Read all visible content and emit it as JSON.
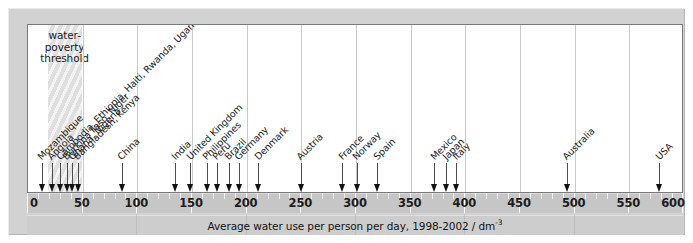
{
  "chart_data": {
    "type": "scatter",
    "title": "",
    "xlabel": "Average water use per person per day, 1998-2002 / dm",
    "xlabel_sup": "-3",
    "ylabel": "",
    "xlim": [
      0,
      600
    ],
    "xticks": [
      0,
      50,
      100,
      150,
      200,
      250,
      300,
      350,
      400,
      450,
      500,
      550,
      600
    ],
    "xtick_labels": [
      "0",
      "50",
      "100",
      "150",
      "200",
      "250",
      "300",
      "350",
      "400",
      "450",
      "500",
      "550",
      "600"
    ],
    "minor_tick_step": 10,
    "grid": true,
    "legend": "none",
    "annotation": {
      "text": "water-\npoverty\nthreshold",
      "band_start": 18,
      "band_end": 49
    },
    "markers": [
      {
        "label": "Mozambique",
        "value": 13
      },
      {
        "label": "Angola",
        "value": 22
      },
      {
        "label": "Cambodia",
        "value": 30
      },
      {
        "label": "Ethiopia",
        "value": 36
      },
      {
        "label": "Haiti",
        "value": 38
      },
      {
        "label": "Rwanda",
        "value": 40
      },
      {
        "label": "Uganda",
        "value": 42
      },
      {
        "label": "Burkina Faso",
        "value": 30
      },
      {
        "label": "Niger",
        "value": 32
      },
      {
        "label": "Ghana",
        "value": 36
      },
      {
        "label": "Nigeria",
        "value": 38
      },
      {
        "label": "Bangladesh",
        "value": 46
      },
      {
        "label": "Kenya",
        "value": 49
      },
      {
        "label": "China",
        "value": 86
      },
      {
        "label": "India",
        "value": 135
      },
      {
        "label": "United Kingdom",
        "value": 149
      },
      {
        "label": "Philippines",
        "value": 164
      },
      {
        "label": "Peru",
        "value": 173
      },
      {
        "label": "Brazil",
        "value": 184
      },
      {
        "label": "Germany",
        "value": 193
      },
      {
        "label": "Denmark",
        "value": 211
      },
      {
        "label": "Austria",
        "value": 250
      },
      {
        "label": "France",
        "value": 288
      },
      {
        "label": "Norway",
        "value": 301
      },
      {
        "label": "Spain",
        "value": 320
      },
      {
        "label": "Mexico",
        "value": 372
      },
      {
        "label": "Japan",
        "value": 383
      },
      {
        "label": "Italy",
        "value": 392
      },
      {
        "label": "Australia",
        "value": 493
      },
      {
        "label": "USA",
        "value": 578
      }
    ],
    "arrow_groups": [
      {
        "labels": [
          "Mozambique"
        ],
        "value": 13
      },
      {
        "labels": [
          "Angola"
        ],
        "value": 22
      },
      {
        "labels": [
          "Cambodia",
          "Burkina Faso"
        ],
        "value": 30
      },
      {
        "labels": [
          "Ethiopia",
          "Ghana"
        ],
        "value": 38
      },
      {
        "labels": [
          "Haiti",
          "Nigeria",
          "Niger"
        ],
        "value": 43
      },
      {
        "labels": [
          "Rwanda",
          "Uganda",
          "Bangladesh",
          "Kenya"
        ],
        "value": 49
      },
      {
        "labels": [
          "China"
        ],
        "value": 86
      },
      {
        "labels": [
          "India"
        ],
        "value": 135
      },
      {
        "labels": [
          "United Kingdom"
        ],
        "value": 149
      },
      {
        "labels": [
          "Philippines"
        ],
        "value": 164
      },
      {
        "labels": [
          "Peru"
        ],
        "value": 173
      },
      {
        "labels": [
          "Brazil"
        ],
        "value": 184
      },
      {
        "labels": [
          "Germany"
        ],
        "value": 193
      },
      {
        "labels": [
          "Denmark"
        ],
        "value": 211
      },
      {
        "labels": [
          "Austria"
        ],
        "value": 250
      },
      {
        "labels": [
          "France"
        ],
        "value": 288
      },
      {
        "labels": [
          "Norway"
        ],
        "value": 301
      },
      {
        "labels": [
          "Spain"
        ],
        "value": 320
      },
      {
        "labels": [
          "Mexico"
        ],
        "value": 372
      },
      {
        "labels": [
          "Japan"
        ],
        "value": 383
      },
      {
        "labels": [
          "Italy"
        ],
        "value": 392
      },
      {
        "labels": [
          "Australia"
        ],
        "value": 493
      },
      {
        "labels": [
          "USA"
        ],
        "value": 578
      }
    ],
    "label_stack": [
      {
        "text": "Mozambique",
        "value": 13
      },
      {
        "text": "Angola",
        "value": 22
      },
      {
        "text": "Cambodia, Ethiopia, Haiti, Rwanda, Uganda",
        "value": 30
      },
      {
        "text": "Burkina Faso, Niger",
        "value": 36
      },
      {
        "text": "Ghana, Nigeria",
        "value": 41
      },
      {
        "text": "Bangladesh, Kenya",
        "value": 46
      },
      {
        "text": "China",
        "value": 86
      },
      {
        "text": "India",
        "value": 135
      },
      {
        "text": "United Kingdom",
        "value": 149
      },
      {
        "text": "Philippines",
        "value": 164
      },
      {
        "text": "Peru",
        "value": 173
      },
      {
        "text": "Brazil",
        "value": 184
      },
      {
        "text": "Germany",
        "value": 193
      },
      {
        "text": "Denmark",
        "value": 211
      },
      {
        "text": "Austria",
        "value": 250
      },
      {
        "text": "France",
        "value": 288
      },
      {
        "text": "Norway",
        "value": 301
      },
      {
        "text": "Spain",
        "value": 320
      },
      {
        "text": "Mexico",
        "value": 372
      },
      {
        "text": "Japan",
        "value": 383
      },
      {
        "text": "Italy",
        "value": 392
      },
      {
        "text": "Australia",
        "value": 493
      },
      {
        "text": "USA",
        "value": 578
      }
    ]
  },
  "colors": {
    "background": "#ffffff",
    "mount": "#d2d2d2",
    "panel": "#ffffff",
    "panel_border": "#7a7a7a",
    "gridline": "#c9c9c9",
    "band": "#e4e4e4",
    "ruler": "#c6c6c6",
    "caption_bar": "#cdcdcd",
    "arrow": "#121212",
    "text": "#1b1b1b"
  },
  "caption": {
    "text": "Average water use per person per day, 1998-2002 / dm",
    "superscript": "-3"
  },
  "threshold": {
    "line1": "water-",
    "line2": "poverty",
    "line3": "threshold"
  }
}
